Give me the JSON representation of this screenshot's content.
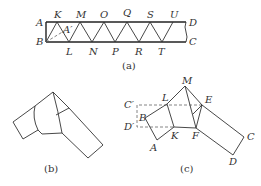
{
  "figure_a": {
    "caption": "(a)",
    "corner_labels": {
      "A": "A",
      "B": "B",
      "C": "C",
      "D": "D",
      "A_prime": "A′"
    },
    "top_labels": [
      "K",
      "M",
      "O",
      "Q",
      "S",
      "U"
    ],
    "bottom_labels": [
      "L",
      "N",
      "P",
      "R",
      "T"
    ]
  },
  "figure_b": {
    "caption": "(b)"
  },
  "figure_c": {
    "caption": "(c)",
    "labels": {
      "M": "M",
      "L": "L",
      "E": "E",
      "C_prime": "C′",
      "D_prime": "D′",
      "B": "B",
      "K": "K",
      "F": "F",
      "A": "A",
      "C": "C",
      "D": "D"
    }
  }
}
